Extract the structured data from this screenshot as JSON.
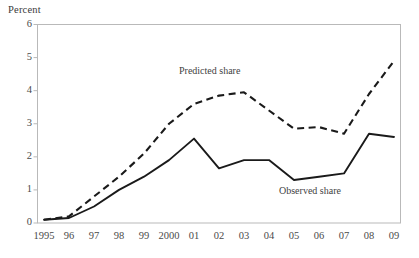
{
  "chart_data": {
    "type": "line",
    "title": "",
    "ylabel": "Percent",
    "xlabel": "",
    "ylim": [
      0,
      6
    ],
    "yticks": [
      "0",
      "1",
      "2",
      "3",
      "4",
      "5",
      "6"
    ],
    "grid": false,
    "legend_position": "inline-annotations",
    "x": [
      "1995",
      "1996",
      "1997",
      "1998",
      "1999",
      "2000",
      "2001",
      "2002",
      "2003",
      "2004",
      "2005",
      "2006",
      "2007",
      "2008",
      "2009"
    ],
    "xtick_labels": [
      "1995",
      "96",
      "97",
      "98",
      "99",
      "2000",
      "01",
      "02",
      "03",
      "04",
      "05",
      "06",
      "07",
      "08",
      "09"
    ],
    "series": [
      {
        "name": "Predicted share",
        "style": "dashed",
        "color": "#1a1a1a",
        "values": [
          0.1,
          0.2,
          0.8,
          1.4,
          2.1,
          3.0,
          3.6,
          3.85,
          3.95,
          3.4,
          2.85,
          2.9,
          2.7,
          3.9,
          4.9
        ]
      },
      {
        "name": "Observed share",
        "style": "solid",
        "color": "#1a1a1a",
        "values": [
          0.1,
          0.15,
          0.5,
          1.0,
          1.4,
          1.9,
          2.55,
          1.65,
          1.9,
          1.9,
          1.3,
          1.4,
          1.5,
          2.7,
          2.6
        ]
      }
    ],
    "annotations": [
      {
        "text": "Predicted share",
        "x": 2002,
        "y": 4.55
      },
      {
        "text": "Observed share",
        "x": 2006,
        "y": 0.95
      }
    ]
  },
  "axis": {
    "y_title": "Percent"
  },
  "labels": {
    "predicted": "Predicted share",
    "observed": "Observed share"
  }
}
